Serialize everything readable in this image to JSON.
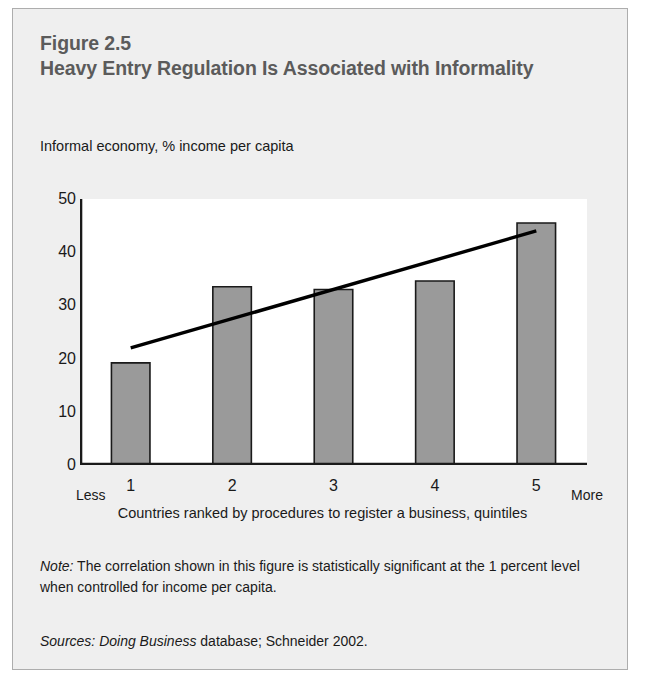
{
  "figure": {
    "number": "Figure 2.5",
    "title": "Heavy Entry Regulation Is Associated with Informality",
    "note_label": "Note:",
    "note_text": " The correlation shown in this figure is statistically significant at the 1 percent level when controlled for income per capita.",
    "sources_label": "Sources:",
    "sources_italic_part": " Doing Business",
    "sources_rest": " database; Schneider 2002."
  },
  "chart_data": {
    "type": "bar",
    "title": "Heavy Entry Regulation Is Associated with Informality",
    "subtitle": "Figure 2.5",
    "categories": [
      "1",
      "2",
      "3",
      "4",
      "5"
    ],
    "values": [
      19.2,
      33.5,
      33.0,
      34.6,
      45.5
    ],
    "series": [
      {
        "name": "Informal economy, % income per capita",
        "values": [
          19.2,
          33.5,
          33.0,
          34.6,
          45.5
        ]
      }
    ],
    "trendline": {
      "x_start": 1,
      "y_start": 22.0,
      "x_end": 5,
      "y_end": 44.0
    },
    "ylabel": "Informal economy, % income per capita",
    "xlabel": "Countries ranked by procedures to register a business, quintiles",
    "ylim": [
      0,
      50
    ],
    "yticks": [
      0,
      10,
      20,
      30,
      40,
      50
    ],
    "xtick_end_low": "Less",
    "xtick_end_high": "More",
    "grid": false,
    "legend": "none",
    "bar_color": "#9a9a9a",
    "bar_edge_color": "#1a1a1a",
    "trendline_color": "#000000",
    "plot_bg": "#ffffff",
    "card_bg": "#efefef"
  }
}
